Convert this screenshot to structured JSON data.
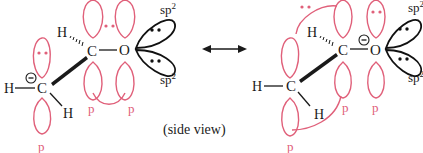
{
  "colors": {
    "p_orbital": "#e0607a",
    "sp2_orbital": "#111111",
    "bond": "#1a1a1a",
    "text": "#1a1a1a"
  },
  "labels": {
    "sp2_top": "sp",
    "sp2_bottom": "sp",
    "sp2_superscript": "2",
    "p": "p",
    "side_view": "(side view)",
    "charge": "−"
  },
  "left_structure": {
    "atoms": {
      "carbon_anion": "C",
      "carbon_center": "C",
      "oxygen": "O",
      "h_left": "H",
      "h_bottom": "H",
      "h_top": "H"
    },
    "p_labels": [
      "p",
      "p",
      "p"
    ],
    "sp2_labels": [
      "sp",
      "sp"
    ]
  },
  "right_structure": {
    "atoms": {
      "carbon_left": "C",
      "carbon_center": "C",
      "oxygen": "O",
      "h_left": "H",
      "h_bottom": "H",
      "h_top": "H"
    },
    "p_labels": [
      "p",
      "p",
      "p"
    ],
    "sp2_labels": [
      "sp",
      "sp"
    ]
  },
  "resonance_arrow": "double-headed-arrow"
}
